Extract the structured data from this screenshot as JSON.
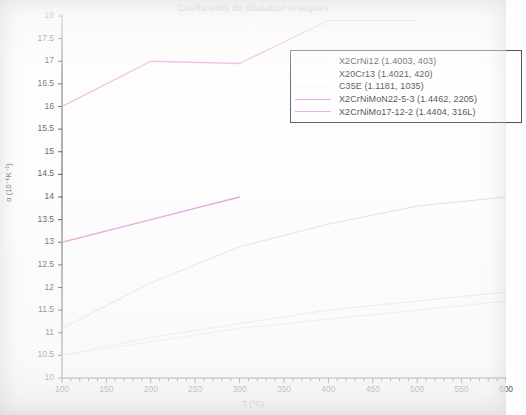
{
  "chart_data": {
    "type": "line",
    "title": "Coefficients de dilatation lineiques",
    "xlabel": "T (°C)",
    "ylabel": "α (10⁻⁶K⁻¹)",
    "xlim": [
      100,
      600
    ],
    "ylim": [
      10,
      18
    ],
    "grid": false,
    "legend_position": "upper-right",
    "x_ticks": [
      "100",
      "150",
      "200",
      "250",
      "300",
      "350",
      "400",
      "450",
      "500",
      "550",
      "600"
    ],
    "x_tick_values": [
      100,
      150,
      200,
      250,
      300,
      350,
      400,
      450,
      500,
      550,
      600
    ],
    "x_minor_step": 10,
    "y_ticks": [
      "10",
      "10.5",
      "11",
      "11.5",
      "12",
      "12.5",
      "13",
      "13.5",
      "14",
      "14.5",
      "15",
      "15.5",
      "16",
      "16.5",
      "17",
      "17.5",
      "18"
    ],
    "y_tick_values": [
      10,
      10.5,
      11,
      11.5,
      12,
      12.5,
      13,
      13.5,
      14,
      14.5,
      15,
      15.5,
      16,
      16.5,
      17,
      17.5,
      18
    ],
    "series": [
      {
        "name": "X2CrNi12 (1.4003, 403)",
        "color": "#d9cfe0",
        "x": [
          100,
          200,
          300,
          400,
          500,
          600
        ],
        "values": [
          10.5,
          10.9,
          11.2,
          11.5,
          11.7,
          11.9
        ]
      },
      {
        "name": "X20Cr13 (1.4021, 420)",
        "color": "#ded4e4",
        "x": [
          100,
          200,
          300,
          400,
          500,
          600
        ],
        "values": [
          10.5,
          10.8,
          11.1,
          11.3,
          11.5,
          11.7
        ]
      },
      {
        "name": "C35E (1.1181, 1035)",
        "color": "#cfc6d6",
        "x": [
          100,
          200,
          300,
          400,
          500,
          600
        ],
        "values": [
          11.1,
          12.1,
          12.9,
          13.4,
          13.8,
          14.0
        ]
      },
      {
        "name": "X2CrNiMoN22-5-3 (1.4462, 2205)",
        "color": "#e89ed8",
        "x": [
          100,
          200,
          300
        ],
        "values": [
          13.0,
          13.5,
          14.0
        ]
      },
      {
        "name": "X2CrNiMo17-12-2 (1.4404, 316L)",
        "color": "#e8a8e0",
        "x": [
          100,
          200,
          300,
          400,
          500
        ],
        "values": [
          16.0,
          17.0,
          16.95,
          17.9,
          17.9
        ]
      }
    ]
  },
  "legend": {
    "entries": [
      "X2CrNi12 (1.4003, 403)",
      "X20Cr13 (1.4021, 420)",
      "C35E (1.1181, 1035)",
      "X2CrNiMoN22-5-3 (1.4462, 2205)",
      "X2CrNiMo17-12-2 (1.4404, 316L)"
    ]
  },
  "axes": {
    "axis_color": "#5a575a"
  }
}
